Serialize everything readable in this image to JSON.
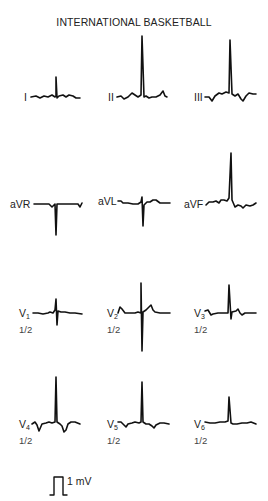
{
  "title": "INTERNATIONAL BASKETBALL",
  "stroke_color": "#111111",
  "leads": [
    {
      "id": "I",
      "label": "I",
      "sub": "",
      "scale": "",
      "x": 22,
      "y": 91,
      "sx": 0,
      "sy": 0
    },
    {
      "id": "II",
      "label": "II",
      "sub": "",
      "scale": "",
      "x": 108,
      "y": 91,
      "sx": 0,
      "sy": 0
    },
    {
      "id": "III",
      "label": "III",
      "sub": "",
      "scale": "",
      "x": 195,
      "y": 91,
      "sx": 0,
      "sy": 0
    },
    {
      "id": "aVR",
      "label": "aVR",
      "sub": "",
      "scale": "",
      "x": 10,
      "y": 199,
      "sx": 0,
      "sy": 0
    },
    {
      "id": "aVL",
      "label": "aVL",
      "sub": "",
      "scale": "",
      "x": 98,
      "y": 199,
      "sx": 0,
      "sy": 0
    },
    {
      "id": "aVF",
      "label": "aVF",
      "sub": "",
      "scale": "",
      "x": 184,
      "y": 199,
      "sx": 0,
      "sy": 0
    },
    {
      "id": "V1",
      "label": "V",
      "sub": "1",
      "scale": "1/2",
      "x": 19,
      "y": 310,
      "sx": 19,
      "sy": 325
    },
    {
      "id": "V2",
      "label": "V",
      "sub": "2",
      "scale": "1/2",
      "x": 107,
      "y": 310,
      "sx": 107,
      "sy": 325
    },
    {
      "id": "V3",
      "label": "V",
      "sub": "3",
      "scale": "1/2",
      "x": 194,
      "y": 310,
      "sx": 194,
      "sy": 325
    },
    {
      "id": "V4",
      "label": "V",
      "sub": "4",
      "scale": "1/2",
      "x": 19,
      "y": 421,
      "sx": 19,
      "sy": 436
    },
    {
      "id": "V5",
      "label": "V",
      "sub": "5",
      "scale": "1/2",
      "x": 107,
      "y": 421,
      "sx": 107,
      "sy": 436
    },
    {
      "id": "V6",
      "label": "V",
      "sub": "6",
      "scale": "1/2",
      "x": 194,
      "y": 421,
      "sx": 194,
      "sy": 436
    }
  ],
  "calibration": {
    "label": "1 mV"
  }
}
